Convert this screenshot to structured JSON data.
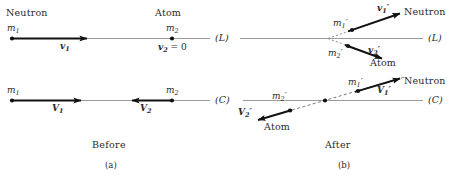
{
  "figure": {
    "title_caption_left": "Before",
    "title_caption_right": "After",
    "subcaption_left": "(a)",
    "subcaption_right": "(b)",
    "colors": {
      "axis": "#9a9a9a",
      "vector": "#111111",
      "text": "#2a2a2a",
      "dashed": "#6b6b6b"
    }
  },
  "panel_a": {
    "name": "Before",
    "lab_frame": {
      "frame_label": "(L)",
      "neutron_title": "Neutron",
      "atom_title": "Atom",
      "mass1": "m",
      "mass1_sub": "1",
      "mass2": "m",
      "mass2_sub": "2",
      "velocity1": "v",
      "velocity1_sub": "1",
      "velocity2_zero": "v",
      "velocity2_zero_sub": "2",
      "velocity2_zero_tail": " = 0"
    },
    "cm_frame": {
      "frame_label": "(C)",
      "mass1": "m",
      "mass1_sub": "1",
      "mass2": "m",
      "mass2_sub": "2",
      "velocity1": "V",
      "velocity1_sub": "1",
      "velocity2": "V",
      "velocity2_sub": "2"
    }
  },
  "panel_b": {
    "name": "After",
    "lab_frame": {
      "frame_label": "(L)",
      "neutron_title": "Neutron",
      "atom_title": "Atom",
      "mass1": "m",
      "mass1_sub": "1",
      "mass1_prime": "′",
      "mass2": "m",
      "mass2_sub": "2",
      "mass2_prime": "′",
      "velocity1": "v",
      "velocity1_sub": "1",
      "velocity1_prime": "′",
      "velocity2": "v",
      "velocity2_sub": "2",
      "velocity2_prime": "′"
    },
    "cm_frame": {
      "frame_label": "(C)",
      "neutron_title": "Neutron",
      "atom_title": "Atom",
      "mass1": "m",
      "mass1_sub": "1",
      "mass1_prime": "′",
      "mass2": "m",
      "mass2_sub": "2",
      "mass2_prime": "′",
      "velocity1": "V",
      "velocity1_sub": "1",
      "velocity1_prime": "′",
      "velocity2": "V",
      "velocity2_sub": "2",
      "velocity2_prime": "′"
    }
  }
}
